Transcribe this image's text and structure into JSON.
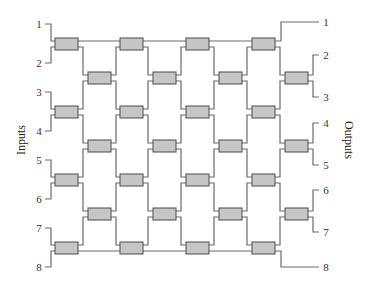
{
  "diagram": {
    "inputs_label": "Inputs",
    "outputs_label": "Outputs",
    "inputs": [
      "1",
      "2",
      "3",
      "4",
      "5",
      "6",
      "7",
      "8"
    ],
    "outputs": [
      "1",
      "2",
      "3",
      "4",
      "5",
      "6",
      "7",
      "8"
    ],
    "colors": {
      "box_fill": "#c6c6c6",
      "box_stroke": "#4a4a4a",
      "wire": "#6a6a6a",
      "text": "#333333"
    },
    "grid": {
      "columns": 8,
      "odd_column_rows": 4,
      "even_column_rows": 3,
      "column_x": [
        55,
        88,
        120,
        153,
        186,
        219,
        252,
        285
      ],
      "odd_row_top": [
        38,
        106,
        174,
        242
      ],
      "even_row_top": [
        72,
        140,
        208
      ],
      "box_width": 23,
      "box_height": 12
    }
  }
}
